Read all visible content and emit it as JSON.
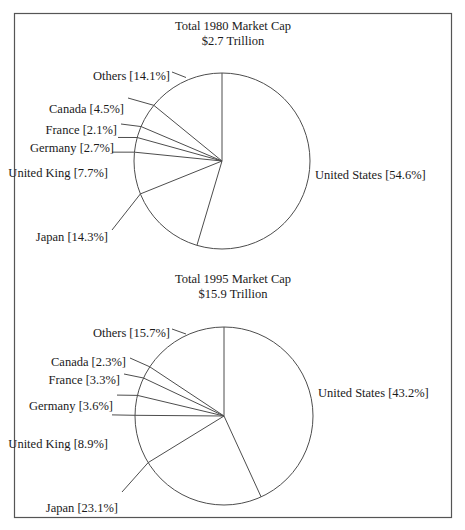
{
  "figure": {
    "background_color": "#ffffff",
    "border_color": "#555555",
    "text_color": "#1a1a1a",
    "line_color": "#4d4d4d"
  },
  "chart_data": [
    {
      "type": "pie",
      "title": "Total 1980 Market Cap",
      "subtitle": "$2.7 Trillion",
      "categories": [
        "United States",
        "Japan",
        "United King",
        "Germany",
        "France",
        "Canada",
        "Others"
      ],
      "values": [
        54.6,
        14.3,
        7.7,
        2.7,
        2.1,
        4.5,
        14.1
      ],
      "unit": "%",
      "labels": [
        "United States [54.6%]",
        "Japan [14.3%]",
        "United King [7.7%]",
        "Germany [2.7%]",
        "France [2.1%]",
        "Canada [4.5%]",
        "Others [14.1%]"
      ],
      "start_angle_deg": 0,
      "direction": "clockwise",
      "legend": "none",
      "grid": false
    },
    {
      "type": "pie",
      "title": "Total 1995 Market Cap",
      "subtitle": "$15.9 Trillion",
      "categories": [
        "United States",
        "Japan",
        "United King",
        "Germany",
        "France",
        "Canada",
        "Others"
      ],
      "values": [
        43.2,
        23.1,
        8.9,
        3.6,
        3.3,
        2.3,
        15.7
      ],
      "unit": "%",
      "labels": [
        "United States [43.2%]",
        "Japan [23.1%]",
        "United King [8.9%]",
        "Germany [3.6%]",
        "France [3.3%]",
        "Canada [2.3%]",
        "Others [15.7%]"
      ],
      "start_angle_deg": 0,
      "direction": "clockwise",
      "legend": "none",
      "grid": false
    }
  ]
}
